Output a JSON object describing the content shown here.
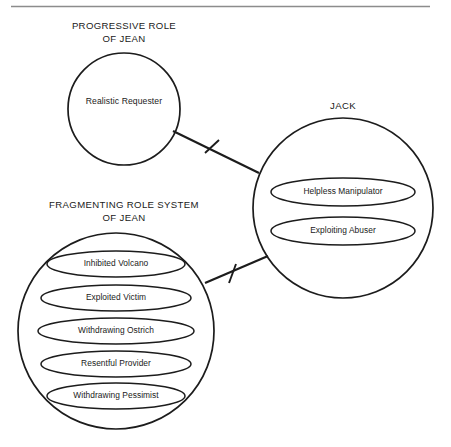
{
  "figure": {
    "type": "diagram",
    "background_color": "#ffffff",
    "line_color": "#1c1c1c",
    "rule_color": "#8c8c8c"
  },
  "top_rule": {
    "name": "horizontal-rule"
  },
  "groups": [
    {
      "id": "progressive-role-of-jean",
      "title_line_1": "PROGRESSIVE ROLE",
      "title_line_2": "OF JEAN",
      "title_x": 124,
      "title_y1": 26,
      "title_y2": 39,
      "circle": {
        "cx": 124,
        "cy": 109,
        "r": 56
      },
      "members": [
        {
          "label": "Realistic Requester",
          "x": 124,
          "y": 102,
          "ellipse": false
        }
      ]
    },
    {
      "id": "jack",
      "title_line_1": "JACK",
      "title_line_2": "",
      "title_x": 343,
      "title_y1": 106,
      "title_y2": 0,
      "circle": {
        "cx": 343,
        "cy": 208,
        "r": 90
      },
      "members": [
        {
          "label": "Helpless Manipulator",
          "x": 343,
          "y": 192,
          "ellipse": true,
          "rx": 72,
          "ry": 14
        },
        {
          "label": "Exploiting Abuser",
          "x": 343,
          "y": 231,
          "ellipse": true,
          "rx": 72,
          "ry": 14
        }
      ]
    },
    {
      "id": "fragmenting-role-system-of-jean",
      "title_line_1": "FRAGMENTING ROLE SYSTEM",
      "title_line_2": "OF JEAN",
      "title_x": 124,
      "title_y1": 205,
      "title_y2": 218,
      "circle": {
        "cx": 116,
        "cy": 331,
        "r": 98
      },
      "members": [
        {
          "label": "Inhibited Volcano",
          "x": 116,
          "y": 264,
          "ellipse": true,
          "rx": 69,
          "ry": 13
        },
        {
          "label": "Exploited Victim",
          "x": 116,
          "y": 298,
          "ellipse": true,
          "rx": 75,
          "ry": 13
        },
        {
          "label": "Withdrawing Ostrich",
          "x": 116,
          "y": 331,
          "ellipse": true,
          "rx": 78,
          "ry": 13
        },
        {
          "label": "Resentful Provider",
          "x": 116,
          "y": 364,
          "ellipse": true,
          "rx": 75,
          "ry": 13
        },
        {
          "label": "Withdrawing Pessimist",
          "x": 116,
          "y": 396,
          "ellipse": true,
          "rx": 69,
          "ry": 13
        }
      ]
    }
  ],
  "connectors": [
    {
      "id": "connector-progressive-to-jack",
      "from": "progressive-role-of-jean",
      "to": "jack",
      "x1": 173,
      "y1": 131,
      "x2": 259,
      "y2": 173,
      "hash": {
        "x1": 205,
        "y1": 153,
        "x2": 219,
        "y2": 140
      }
    },
    {
      "id": "connector-fragmenting-to-jack",
      "from": "fragmenting-role-system-of-jean",
      "to": "jack",
      "x1": 205,
      "y1": 283,
      "x2": 268,
      "y2": 256,
      "hash": {
        "x1": 229,
        "y1": 283,
        "x2": 236,
        "y2": 265
      }
    }
  ]
}
